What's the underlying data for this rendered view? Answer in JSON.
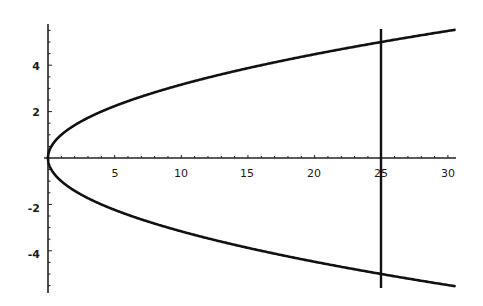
{
  "chart_data": {
    "type": "line",
    "title": "",
    "xlabel": "",
    "ylabel": "",
    "xlim": [
      0,
      30.5
    ],
    "ylim": [
      -5.6,
      5.6
    ],
    "grid": false,
    "legend": null,
    "x_ticks": [
      5,
      10,
      15,
      20,
      25,
      30
    ],
    "x_tick_labels": [
      "5",
      "10",
      "15",
      "20",
      "25",
      "30"
    ],
    "y_ticks": [
      -4,
      -2,
      2,
      4
    ],
    "y_tick_labels": [
      "-4",
      "-2",
      "2",
      "4"
    ],
    "series": [
      {
        "name": "upper branch y = sqrt(x)",
        "x": [
          0,
          0.25,
          1,
          2,
          4,
          6,
          9,
          12,
          16,
          20,
          25,
          30,
          30.5
        ],
        "y": [
          0,
          0.5,
          1,
          1.41,
          2,
          2.45,
          3,
          3.46,
          4,
          4.47,
          5,
          5.48,
          5.52
        ]
      },
      {
        "name": "lower branch y = -sqrt(x)",
        "x": [
          0,
          0.25,
          1,
          2,
          4,
          6,
          9,
          12,
          16,
          20,
          25,
          30,
          30.5
        ],
        "y": [
          0,
          -0.5,
          -1,
          -1.41,
          -2,
          -2.45,
          -3,
          -3.46,
          -4,
          -4.47,
          -5,
          -5.48,
          -5.52
        ]
      },
      {
        "name": "vertical line x = 25",
        "x": [
          25,
          25
        ],
        "y": [
          -5.5,
          5.5
        ]
      }
    ],
    "annotations": []
  },
  "axes": {
    "x_labels": [
      "5",
      "10",
      "15",
      "20",
      "25",
      "30"
    ],
    "y_labels": [
      "4",
      "2",
      "-2",
      "-4"
    ]
  }
}
